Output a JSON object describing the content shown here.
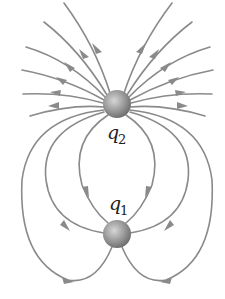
{
  "diagram": {
    "type": "electric-field-lines",
    "charges": [
      {
        "id": "q2",
        "label": "q",
        "subscript": "2",
        "position": "top",
        "field_direction": "outward"
      },
      {
        "id": "q1",
        "label": "q",
        "subscript": "1",
        "position": "bottom",
        "field_direction": "inward-from-q2 and outward-downward"
      }
    ],
    "colors": {
      "field_line": "#8a8a8a",
      "charge_sphere": "#9a9a9a",
      "background": "#ffffff"
    }
  }
}
